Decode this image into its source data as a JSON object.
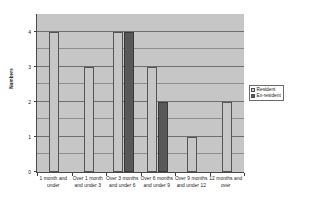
{
  "chart_data": {
    "type": "bar",
    "title": "",
    "xlabel": "",
    "ylabel": "Numbers",
    "ylim": [
      0,
      4.5
    ],
    "yticks": [
      0,
      1,
      2,
      3,
      4
    ],
    "ytick_labels": [
      "0",
      "1",
      "2",
      "3",
      "4"
    ],
    "grid": true,
    "minor_gridlines": [
      0.5,
      1.5,
      2.5,
      3.5
    ],
    "legend_position": "right",
    "categories": [
      "1 month and under",
      "Over 1 month and under 3",
      "Over 3 months and under 6",
      "Over 6 months and under 9",
      "Over 9 months and under 12",
      "12 months and over"
    ],
    "series": [
      {
        "name": "Resident",
        "color": "#c6c6c6",
        "values": [
          4,
          3,
          4,
          3,
          1,
          2
        ]
      },
      {
        "name": "Ex-resident",
        "color": "#585858",
        "values": [
          0,
          0,
          4,
          2,
          0,
          0
        ]
      }
    ]
  },
  "axis": {
    "y_title": "Numbers"
  },
  "legend": {
    "items": [
      {
        "label": "Resident"
      },
      {
        "label": "Ex-resident"
      }
    ]
  },
  "colors": {
    "plot_background": "#c6c6c6",
    "resident": "#c6c6c6",
    "exresident": "#585858",
    "gridline": "#8d8d8d",
    "axis": "#3f3f3f",
    "page_background": "#ffffff"
  }
}
